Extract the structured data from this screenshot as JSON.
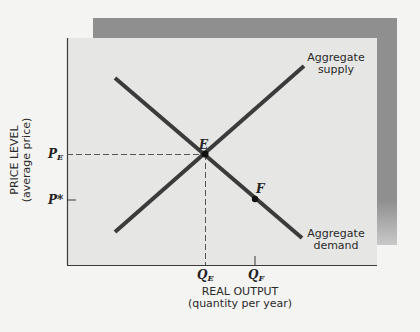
{
  "diagram": {
    "y_axis": {
      "label": "PRICE LEVEL",
      "sublabel": "(average price)",
      "ticks": [
        {
          "id": "PE",
          "label": "P",
          "sub": "E"
        },
        {
          "id": "Pstar",
          "label": "P*",
          "sub": ""
        }
      ]
    },
    "x_axis": {
      "label": "REAL OUTPUT",
      "sublabel": "(quantity per year)",
      "ticks": [
        {
          "id": "QE",
          "label": "Q",
          "sub": "E"
        },
        {
          "id": "QF",
          "label": "Q",
          "sub": "F"
        }
      ]
    },
    "curves": [
      {
        "id": "supply",
        "label_line1": "Aggregate",
        "label_line2": "supply",
        "slope": "upward"
      },
      {
        "id": "demand",
        "label_line1": "Aggregate",
        "label_line2": "demand",
        "slope": "downward"
      }
    ],
    "points": [
      {
        "id": "E",
        "label": "E",
        "meaning": "equilibrium"
      },
      {
        "id": "F",
        "label": "F"
      }
    ],
    "colors": {
      "curve": "#3b3b3b",
      "panel": "#e6e6e4",
      "shadow": "#8f8f8f",
      "background": "#f4f4f2"
    }
  }
}
